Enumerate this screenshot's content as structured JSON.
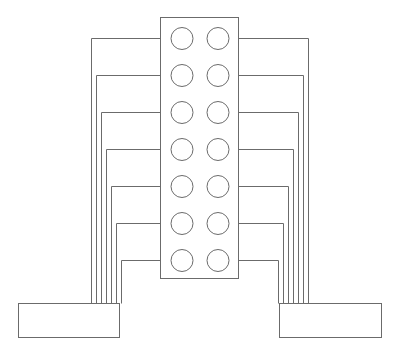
{
  "diagram": {
    "type": "connector-pinout-wiring",
    "colors": {
      "stroke": "#6b6b6b",
      "background": "#ffffff"
    },
    "connector": {
      "x": 160,
      "y": 17,
      "width": 78,
      "height": 261,
      "rows": 7,
      "columns": 2
    },
    "pins": {
      "left_cx": 182,
      "right_cx": 218,
      "radius": 11,
      "row_y": [
        38,
        75,
        112,
        149,
        186,
        223,
        260
      ]
    },
    "left_box": {
      "x": 18,
      "y": 303,
      "width": 101,
      "height": 34
    },
    "right_box": {
      "x": 279,
      "y": 303,
      "width": 102,
      "height": 34
    },
    "left_wire_x": [
      91,
      96,
      101,
      106,
      111,
      116,
      121
    ],
    "right_wire_x": [
      308,
      303,
      298,
      293,
      288,
      283,
      278
    ],
    "labels": []
  }
}
